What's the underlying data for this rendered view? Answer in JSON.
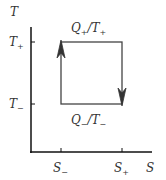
{
  "diagram": {
    "type": "temperature-entropy cycle (Carnot)",
    "axes": {
      "y_label": "T",
      "x_label": "S",
      "y_ticks": [
        {
          "base": "T",
          "sub": "+"
        },
        {
          "base": "T",
          "sub": "−"
        }
      ],
      "x_ticks": [
        {
          "base": "S",
          "sub": "−"
        },
        {
          "base": "S",
          "sub": "+"
        }
      ]
    },
    "edges": {
      "top": {
        "label_q": "Q",
        "q_sub": "+",
        "label_t": "/T",
        "t_sub": "+"
      },
      "bottom": {
        "label_q": "Q",
        "q_sub": "−",
        "label_t": "/T",
        "t_sub": "−"
      }
    },
    "arrows": [
      "left edge pointing up",
      "right edge pointing down"
    ],
    "colors": {
      "axis": "#111111",
      "cycle": "#444444",
      "text": "#333333"
    }
  }
}
